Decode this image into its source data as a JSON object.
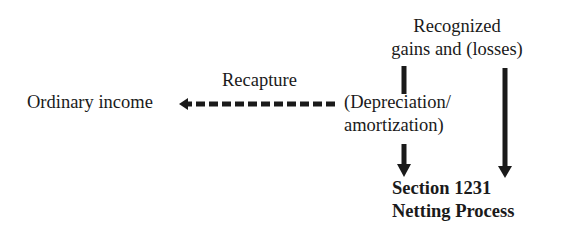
{
  "diagram": {
    "nodes": {
      "recognized": {
        "line1": "Recognized",
        "line2": "gains and (losses)"
      },
      "depreciation": {
        "line1": "(Depreciation/",
        "line2": "amortization)"
      },
      "ordinary_income": {
        "label": "Ordinary income"
      },
      "section1231": {
        "line1": "Section 1231",
        "line2": "Netting Process"
      }
    },
    "edges": [
      {
        "from": "recognized",
        "to": "depreciation",
        "style": "solid",
        "label": ""
      },
      {
        "from": "depreciation",
        "to": "ordinary_income",
        "style": "dashed",
        "label": "Recapture"
      },
      {
        "from": "depreciation",
        "to": "section1231",
        "style": "solid",
        "label": ""
      },
      {
        "from": "recognized",
        "to": "section1231",
        "style": "solid",
        "label": ""
      }
    ],
    "edge_labels": {
      "recapture": "Recapture"
    },
    "colors": {
      "ink": "#1a1a1a",
      "background": "#ffffff"
    }
  }
}
